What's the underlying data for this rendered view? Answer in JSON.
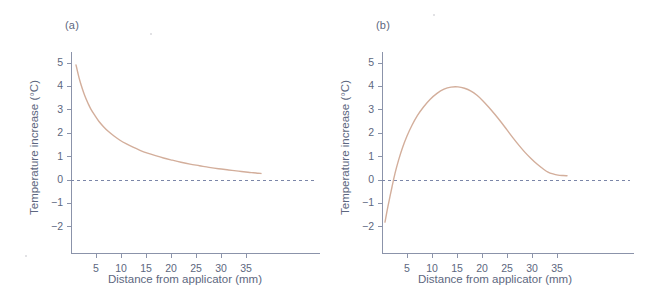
{
  "figure": {
    "panels": [
      {
        "id": "a",
        "label": "(a)"
      },
      {
        "id": "b",
        "label": "(b)"
      }
    ]
  },
  "colors": {
    "curve": "#d3ae9b",
    "axis": "#8b93aa",
    "text": "#5d6780",
    "zero_line": "#7b86a8",
    "background": "#ffffff"
  },
  "chart_data": [
    {
      "type": "line",
      "panel": "(a)",
      "title": "",
      "xlabel": "Distance from applicator (mm)",
      "ylabel": "Temperature increase (°C)",
      "xlim": [
        0,
        40
      ],
      "ylim": [
        -2.5,
        5.2
      ],
      "xticks": [
        5,
        10,
        15,
        20,
        25,
        30,
        35
      ],
      "xtick_labels": [
        "5",
        "10",
        "15",
        "20",
        "25",
        "30",
        "35"
      ],
      "yticks": [
        5,
        4,
        3,
        2,
        1,
        0,
        -1,
        -2
      ],
      "ytick_labels": [
        "5",
        "4",
        "3",
        "2",
        "1",
        "0",
        "−1",
        "−2"
      ],
      "grid": false,
      "legend": null,
      "zero_reference_line": {
        "y": 0,
        "style": "dashed"
      },
      "series": [
        {
          "name": "Temperature increase",
          "x": [
            1.0,
            1.4,
            1.8,
            2.3,
            2.8,
            3.4,
            4.0,
            4.8,
            5.6,
            6.5,
            7.5,
            8.6,
            9.8,
            11.0,
            12.4,
            13.8,
            15.3,
            16.9,
            18.5,
            20.2,
            22.0,
            23.8,
            25.7,
            27.6,
            29.5,
            31.5,
            33.5,
            35.4,
            36.5,
            37.4,
            38.0
          ],
          "y": [
            4.92,
            4.55,
            4.22,
            3.88,
            3.58,
            3.28,
            3.02,
            2.75,
            2.5,
            2.28,
            2.07,
            1.88,
            1.7,
            1.55,
            1.4,
            1.27,
            1.15,
            1.04,
            0.94,
            0.85,
            0.76,
            0.68,
            0.61,
            0.54,
            0.48,
            0.43,
            0.38,
            0.33,
            0.31,
            0.29,
            0.28
          ]
        }
      ]
    },
    {
      "type": "line",
      "panel": "(b)",
      "title": "",
      "xlabel": "Distance from applicator (mm)",
      "ylabel": "Temperature increase (°C)",
      "xlim": [
        0,
        40
      ],
      "ylim": [
        -2.5,
        5.2
      ],
      "xticks": [
        5,
        10,
        15,
        20,
        25,
        30,
        35
      ],
      "xtick_labels": [
        "5",
        "10",
        "15",
        "20",
        "25",
        "30",
        "35"
      ],
      "yticks": [
        5,
        4,
        3,
        2,
        1,
        0,
        -1,
        -2
      ],
      "ytick_labels": [
        "5",
        "4",
        "3",
        "2",
        "1",
        "0",
        "−1",
        "−2"
      ],
      "grid": false,
      "legend": null,
      "zero_reference_line": {
        "y": 0,
        "style": "dashed"
      },
      "series": [
        {
          "name": "Temperature increase",
          "x": [
            0.6,
            0.9,
            1.2,
            1.6,
            2.0,
            2.6,
            3.3,
            4.1,
            5.0,
            6.0,
            7.1,
            8.3,
            9.6,
            11.0,
            12.4,
            13.8,
            15.2,
            16.5,
            17.8,
            19.0,
            20.2,
            21.4,
            22.6,
            23.8,
            25.0,
            26.2,
            27.4,
            28.6,
            29.8,
            31.0,
            32.2,
            33.2,
            34.2,
            35.2,
            36.2,
            37.0
          ],
          "y": [
            -1.8,
            -1.45,
            -1.12,
            -0.7,
            -0.3,
            0.28,
            0.84,
            1.38,
            1.88,
            2.34,
            2.76,
            3.12,
            3.44,
            3.7,
            3.88,
            3.97,
            3.98,
            3.92,
            3.8,
            3.62,
            3.38,
            3.1,
            2.8,
            2.48,
            2.14,
            1.8,
            1.48,
            1.18,
            0.92,
            0.68,
            0.48,
            0.34,
            0.26,
            0.21,
            0.19,
            0.18
          ]
        }
      ]
    }
  ]
}
